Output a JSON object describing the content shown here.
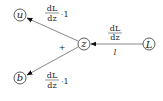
{
  "nodes": {
    "u": {
      "label": "u"
    },
    "b": {
      "label": "b"
    },
    "z": {
      "label": "z"
    },
    "L": {
      "label": "L"
    }
  },
  "edges": {
    "L_to_z": {
      "numerator": "dL",
      "denominator": "dz",
      "below": "l"
    },
    "z_to_u": {
      "numerator": "dL",
      "denominator": "dz",
      "factor": "·1"
    },
    "z_to_b": {
      "numerator": "dL",
      "denominator": "dz",
      "factor": "·1"
    }
  },
  "operator": "+",
  "colors": {
    "edge": "#888888",
    "node_stroke": "#333333",
    "text": "#222222"
  }
}
